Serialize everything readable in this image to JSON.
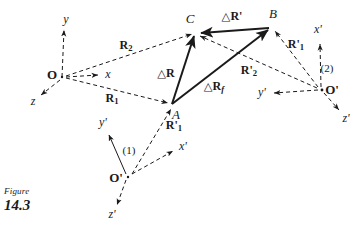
{
  "figure": {
    "caption_word": "Figure",
    "caption_number": "14.3",
    "background_color": "#ffffff",
    "ink_color": "#1a1a1a"
  },
  "points": [
    {
      "id": "O",
      "label": "O",
      "x": 62,
      "y": 77,
      "label_x": 52,
      "label_y": 74
    },
    {
      "id": "A",
      "label": "A",
      "x": 172,
      "y": 105,
      "label_x": 176,
      "label_y": 114
    },
    {
      "id": "B",
      "label": "B",
      "x": 272,
      "y": 27,
      "label_x": 273,
      "label_y": 13
    },
    {
      "id": "C",
      "label": "C",
      "x": 196,
      "y": 32,
      "label_x": 190,
      "label_y": 18
    },
    {
      "id": "O1",
      "label": "O'",
      "x": 128,
      "y": 177,
      "label_x": 116,
      "label_y": 177
    },
    {
      "id": "O2",
      "label": "O'",
      "x": 322,
      "y": 90,
      "label_x": 332,
      "label_y": 89
    }
  ],
  "frames": [
    {
      "name": "fixed-frame",
      "origin": "O",
      "marker": "",
      "axes": [
        {
          "name": "y",
          "label": "y",
          "tip_x": 64,
          "tip_y": 28,
          "label_x": 66,
          "label_y": 19
        },
        {
          "name": "x",
          "label": "x",
          "tip_x": 100,
          "tip_y": 75,
          "label_x": 108,
          "label_y": 74
        },
        {
          "name": "z",
          "label": "z",
          "tip_x": 39,
          "tip_y": 96,
          "label_x": 33,
          "label_y": 101
        }
      ]
    },
    {
      "name": "moving-frame-1",
      "origin": "O1",
      "marker": "(1)",
      "marker_x": 129,
      "marker_y": 150,
      "axes": [
        {
          "name": "y-prime",
          "label": "y'",
          "tip_x": 107,
          "tip_y": 133,
          "label_x": 103,
          "label_y": 122
        },
        {
          "name": "x-prime",
          "label": "x'",
          "tip_x": 175,
          "tip_y": 150,
          "label_x": 183,
          "label_y": 146
        },
        {
          "name": "z-prime",
          "label": "z'",
          "tip_x": 116,
          "tip_y": 207,
          "label_x": 112,
          "label_y": 214
        }
      ]
    },
    {
      "name": "moving-frame-2",
      "origin": "O2",
      "marker": "(2)",
      "marker_x": 327,
      "marker_y": 68,
      "axes": [
        {
          "name": "x-prime",
          "label": "x'",
          "tip_x": 320,
          "tip_y": 42,
          "label_x": 318,
          "label_y": 29
        },
        {
          "name": "y-prime",
          "label": "y'",
          "tip_x": 272,
          "tip_y": 93,
          "label_x": 262,
          "label_y": 92
        },
        {
          "name": "z-prime",
          "label": "z'",
          "tip_x": 341,
          "tip_y": 112,
          "label_x": 346,
          "label_y": 118
        }
      ]
    }
  ],
  "vectors": {
    "dashed": [
      {
        "name": "R2",
        "from_x": 66,
        "from_y": 76,
        "to_x": 194,
        "to_y": 34,
        "label_x": 126,
        "label_y": 46
      },
      {
        "name": "R1",
        "from_x": 66,
        "from_y": 78,
        "to_x": 170,
        "to_y": 104,
        "label_x": 112,
        "label_y": 99
      },
      {
        "name": "R1-prime-A",
        "from_x": 132,
        "from_y": 174,
        "to_x": 172,
        "to_y": 107,
        "label_x": 173,
        "label_y": 126
      },
      {
        "name": "R1-prime-B",
        "from_x": 318,
        "from_y": 87,
        "to_x": 274,
        "to_y": 30,
        "label_x": 295,
        "label_y": 45
      },
      {
        "name": "R2-prime",
        "from_x": 318,
        "from_y": 88,
        "to_x": 198,
        "to_y": 35,
        "label_x": 249,
        "label_y": 71
      }
    ],
    "solid": [
      {
        "name": "deltaR",
        "from_x": 172,
        "from_y": 104,
        "to_x": 195,
        "to_y": 33,
        "label_x": 165,
        "label_y": 73
      },
      {
        "name": "deltaR-prime",
        "from_x": 269,
        "from_y": 28,
        "to_x": 199,
        "to_y": 34,
        "label_x": 232,
        "label_y": 16
      },
      {
        "name": "deltaR-f",
        "from_x": 172,
        "from_y": 104,
        "to_x": 270,
        "to_y": 28,
        "label_x": 214,
        "label_y": 87
      }
    ]
  },
  "labels": {
    "R2": {
      "head": "R",
      "sub": "2",
      "prime": ""
    },
    "R1": {
      "head": "R",
      "sub": "1",
      "prime": ""
    },
    "R1_prime_A": {
      "head": "R",
      "sub": "1",
      "prime": "'"
    },
    "R1_prime_B": {
      "head": "R",
      "sub": "1",
      "prime": "'"
    },
    "R2_prime": {
      "head": "R",
      "sub": "2",
      "prime": "'"
    },
    "deltaR": {
      "tri": "△",
      "head": "R",
      "sub": "",
      "prime": ""
    },
    "deltaR_prime": {
      "tri": "△",
      "head": "R",
      "sub": "",
      "prime": "'"
    },
    "deltaR_f": {
      "tri": "△",
      "head": "R",
      "sub": "f",
      "prime": ""
    }
  }
}
